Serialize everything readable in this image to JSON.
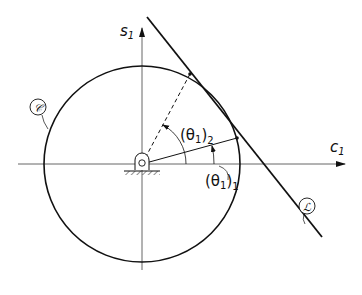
{
  "diagram": {
    "axes": {
      "vertical_label": "s",
      "vertical_subscript": "1",
      "horizontal_label": "c",
      "horizontal_subscript": "1"
    },
    "curves": {
      "circle_label": "𝒞",
      "line_label": "ℒ"
    },
    "angles": [
      {
        "name": "theta1-2",
        "label_open": "(θ",
        "label_sub": "1",
        "label_close": ")",
        "label_outer_sub": "2"
      },
      {
        "name": "theta1-1",
        "label_open": "(θ",
        "label_sub": "1",
        "label_close": ")",
        "label_outer_sub": "1"
      }
    ],
    "colors": {
      "stroke": "#111111",
      "axis": "#555555",
      "background": "#ffffff"
    }
  }
}
